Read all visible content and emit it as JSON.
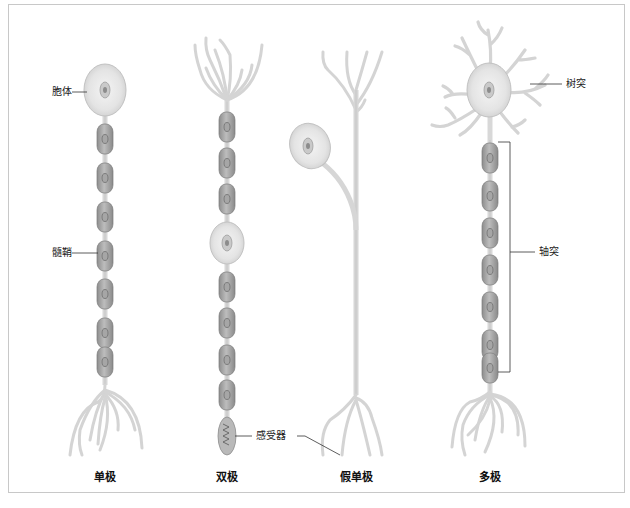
{
  "figure": {
    "title": "",
    "neurons": [
      {
        "id": "unipolar",
        "caption": "单极"
      },
      {
        "id": "bipolar",
        "caption": "双极"
      },
      {
        "id": "pseudounipolar",
        "caption": "假单极"
      },
      {
        "id": "multipolar",
        "caption": "多极"
      }
    ],
    "labels": {
      "cell_body": "胞体",
      "myelin_sheath": "髓鞘",
      "receptor": "感受器",
      "dendrite": "树突",
      "axon": "轴突"
    },
    "colors": {
      "frame": "#c8c8c8",
      "neuron_fill": "#e6e6e6",
      "neuron_stroke": "#b4b4b4",
      "myelin_fill": "#9a9a9a",
      "myelin_light": "#c4c4c4",
      "nucleus": "#8a8a8a",
      "leader_line": "#333333"
    }
  }
}
